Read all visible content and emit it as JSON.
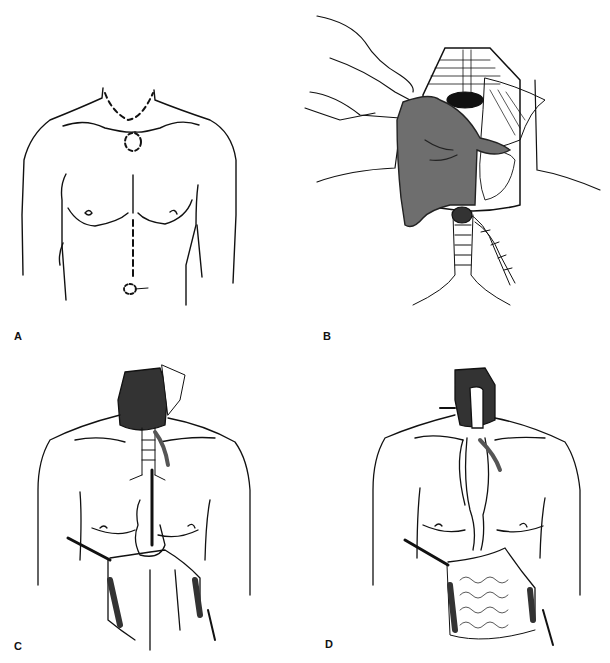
{
  "figure": {
    "panels": [
      {
        "id": "A",
        "label": "A",
        "description": "Male torso outline with dashed cervical and abdominal incision lines"
      },
      {
        "id": "B",
        "label": "B",
        "description": "Gloved hand performing blunt transhiatal mediastinal dissection through neck incision, trachea and esophagus shown"
      },
      {
        "id": "C",
        "label": "C",
        "description": "Esophagus delivered through cervical incision with hand through abdominal incision, retractors in place"
      },
      {
        "id": "D",
        "label": "D",
        "description": "Stomach pulled up through posterior mediastinum for cervical esophagogastric anastomosis"
      }
    ],
    "colors": {
      "ink": "#111111",
      "glove": "#6e6e6e",
      "background": "#ffffff"
    }
  }
}
